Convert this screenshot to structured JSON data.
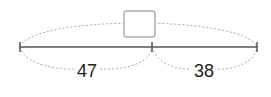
{
  "diagram": {
    "type": "part-whole bar model",
    "total_box": {
      "value": "",
      "description": "empty answer box for total"
    },
    "parts": [
      {
        "label": "47"
      },
      {
        "label": "38"
      }
    ],
    "colors": {
      "line": "#555555",
      "dotted_arc": "#aaaaaa",
      "box_border": "#888888",
      "text": "#222222"
    }
  }
}
